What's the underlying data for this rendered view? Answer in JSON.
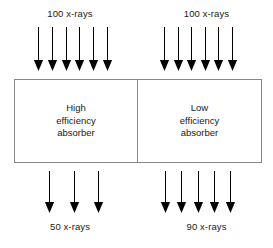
{
  "diagram": {
    "background_color": "#ffffff",
    "line_color": "#888888",
    "arrow_color": "#000000",
    "text_color": "#1a1a1a"
  },
  "panels": {
    "left": {
      "incident_label": "100 x-rays",
      "incident_arrow_count": 6,
      "absorber_name": "High\nefficiency\nabsorber",
      "transmitted_label": "50 x-rays",
      "transmitted_arrow_count": 3
    },
    "right": {
      "incident_label": "100 x-rays",
      "incident_arrow_count": 6,
      "absorber_name": "Low\nefficiency\nabsorber",
      "transmitted_label": "90 x-rays",
      "transmitted_arrow_count": 5
    }
  },
  "icons": {
    "down_arrow": "arrow-down-icon"
  }
}
